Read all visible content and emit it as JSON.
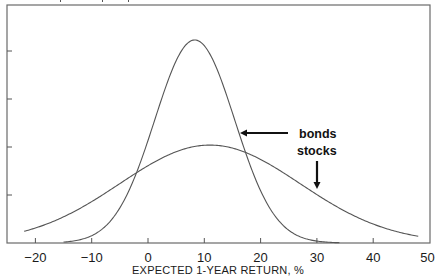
{
  "chart_data": {
    "type": "line",
    "title": "",
    "xlabel": "EXPECTED 1-YEAR RETURN, %",
    "ylabel": "",
    "xlim": [
      -23,
      50
    ],
    "ylim": [
      0,
      4.95
    ],
    "x_ticks": [
      -20,
      -10,
      0,
      10,
      20,
      30,
      40,
      50
    ],
    "x_tick_labels": [
      "−20",
      "−10",
      "0",
      "10",
      "20",
      "30",
      "40",
      "50"
    ],
    "y_ticks": [
      1,
      2,
      3,
      4
    ],
    "y_tick_labels": [
      "",
      "",
      "",
      ""
    ],
    "grid": false,
    "legend": "none (inline annotations with arrows)",
    "series": [
      {
        "name": "bonds",
        "distribution": "normal",
        "mean": 8.3,
        "std": 7.1,
        "peak": 4.23,
        "x": [
          -15,
          -10,
          -5,
          0,
          5,
          8.3,
          10,
          15,
          20,
          25,
          30,
          34
        ],
        "values": [
          0.02,
          0.15,
          0.73,
          2.14,
          3.86,
          4.23,
          4.11,
          2.7,
          1.08,
          0.26,
          0.04,
          0.01
        ]
      },
      {
        "name": "stocks",
        "distribution": "normal",
        "mean": 11,
        "std": 16,
        "peak": 2.04,
        "x": [
          -22,
          -10,
          0,
          10,
          11,
          20,
          30,
          40,
          48
        ],
        "values": [
          0.24,
          0.86,
          1.61,
          2.04,
          2.04,
          1.74,
          1.0,
          0.39,
          0.14
        ]
      }
    ],
    "annotations": [
      {
        "text": "bonds",
        "arrow": "left",
        "points_to_x": 16.2
      },
      {
        "text": "stocks",
        "arrow": "down",
        "points_to_x": 30
      }
    ]
  },
  "labels": {
    "xlabel": "EXPECTED 1-YEAR RETURN, %",
    "bonds": "bonds",
    "stocks": "stocks"
  }
}
